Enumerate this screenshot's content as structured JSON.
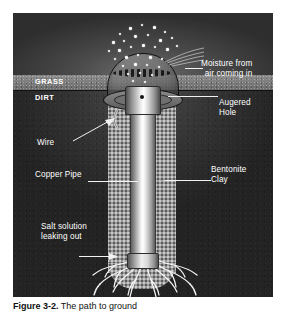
{
  "figure": {
    "caption_label": "Figure 3-2.",
    "caption_text": "The path to ground",
    "alt_title": "Cross-section of a grounding rod installation"
  },
  "diagram": {
    "strata": [
      {
        "id": "sky",
        "label": ""
      },
      {
        "id": "grass",
        "label": "GRASS"
      },
      {
        "id": "dirt",
        "label": "DIRT"
      }
    ],
    "labels": {
      "grass": "GRASS",
      "dirt": "DIRT",
      "moisture": "Moisture from\nair coming in",
      "augered_hole": "Augered\nHole",
      "bentonite_clay": "Bentonite\nClay",
      "wire": "Wire",
      "copper_pipe": "Copper Pipe",
      "salt_solution": "Salt solution\nleaking out"
    },
    "components": [
      {
        "name": "dome-cover",
        "label": "Dome cover"
      },
      {
        "name": "pipe-cap",
        "label": "Pipe cap"
      },
      {
        "name": "copper-pipe",
        "label": "Copper Pipe"
      },
      {
        "name": "augered-hole",
        "label": "Augered Hole"
      },
      {
        "name": "bentonite-clay",
        "label": "Bentonite Clay"
      },
      {
        "name": "salt-roots",
        "label": "Salt solution leaking out"
      },
      {
        "name": "wire",
        "label": "Wire"
      }
    ],
    "colors": {
      "sky": "#2e2e2e",
      "grass": "#7a7a7a",
      "dirt": "#2a2a2a",
      "clay": "#9a9a9a",
      "pipe_highlight": "#ffffff",
      "label_text": "#ffffff",
      "droplet": "#fdfdfd",
      "root": "#f5f5f5"
    }
  }
}
